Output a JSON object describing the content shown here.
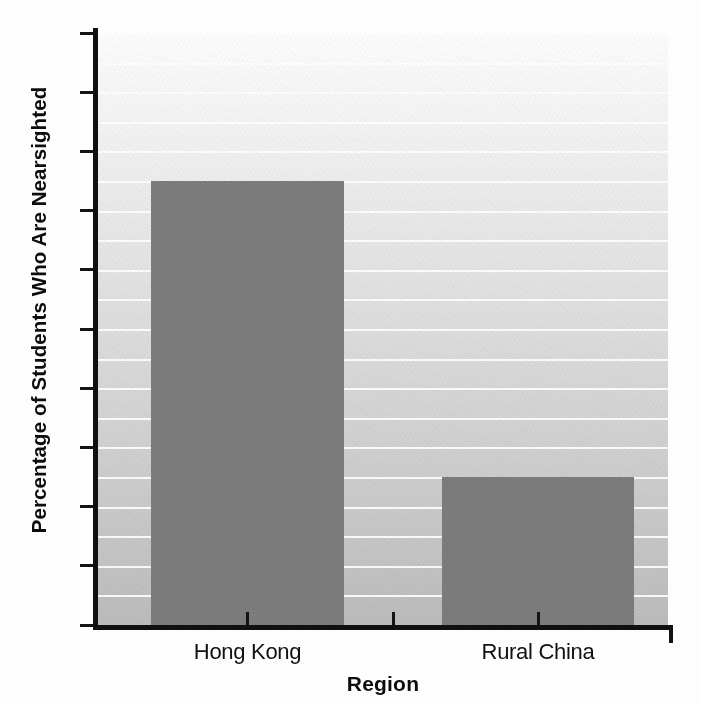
{
  "chart_data": {
    "type": "bar",
    "title": "",
    "categories": [
      "Hong Kong",
      "Rural China"
    ],
    "values": [
      75,
      25
    ],
    "series": [
      {
        "name": "Percentage of Students Who Are Nearsighted",
        "values": [
          75,
          25
        ]
      }
    ],
    "xlabel": "Region",
    "ylabel": "Percentage of Students Who Are Nearsighted",
    "ylim": [
      0,
      100
    ],
    "ytick_labels": [
      "0",
      "10",
      "20",
      "30",
      "40",
      "50",
      "60",
      "70",
      "80",
      "90",
      "100"
    ],
    "ytick_values": [
      0,
      10,
      20,
      30,
      40,
      50,
      60,
      70,
      80,
      90,
      100
    ],
    "ytick_step": 10,
    "gridline_step": 5,
    "grid": true,
    "grid_orientation": "horizontal",
    "grid_color": "#ffffff",
    "legend": false,
    "legend_position": "none",
    "bar_color": "#7d7d7d",
    "axis_color": "#101010",
    "plot_background": "vertical-gradient-white-to-gray"
  },
  "axis": {
    "y_title": "Percentage of Students Who Are Nearsighted",
    "x_title": "Region"
  }
}
